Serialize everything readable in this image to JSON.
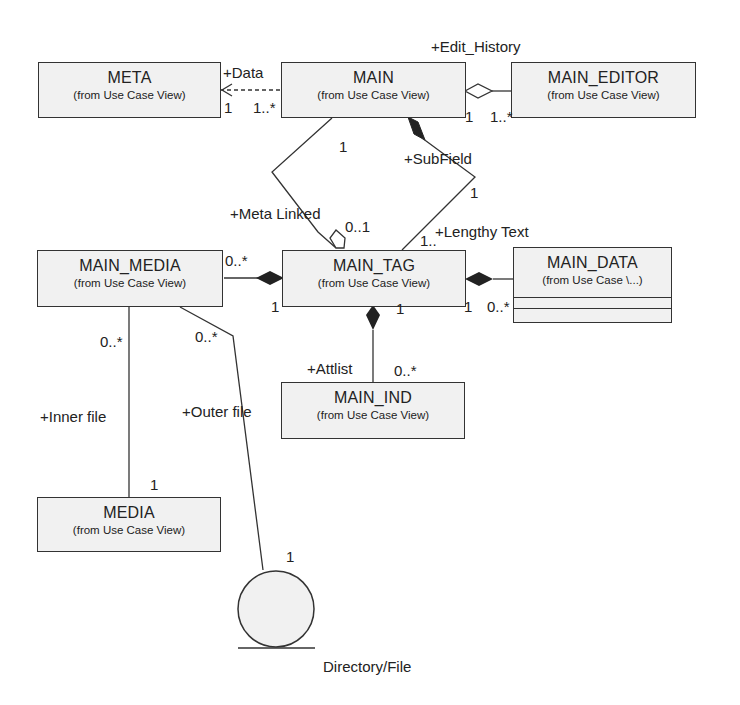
{
  "classes": {
    "meta": {
      "name": "META",
      "from": "(from Use Case View)"
    },
    "main": {
      "name": "MAIN",
      "from": "(from Use Case View)"
    },
    "main_editor": {
      "name": "MAIN_EDITOR",
      "from": "(from Use Case View)"
    },
    "main_media": {
      "name": "MAIN_MEDIA",
      "from": "(from Use Case View)"
    },
    "main_tag": {
      "name": "MAIN_TAG",
      "from": "(from Use Case View)"
    },
    "main_data": {
      "name": "MAIN_DATA",
      "from": "(from Use Case \\...)"
    },
    "main_ind": {
      "name": "MAIN_IND",
      "from": "(from Use Case View)"
    },
    "media": {
      "name": "MEDIA",
      "from": "(from Use Case View)"
    }
  },
  "actor": {
    "label": "Directory/File"
  },
  "associations": {
    "data": {
      "role": "+Data",
      "mult_meta": "1",
      "mult_main": "1..*"
    },
    "edit_history": {
      "role": "+Edit_History",
      "mult_main": "1",
      "mult_editor": "1..*"
    },
    "meta_linked": {
      "role": "+Meta Linked",
      "mult_main": "1",
      "mult_tag": "0..1"
    },
    "subfield": {
      "role": "+SubField",
      "mult_main": "1",
      "mult_tag": "1.."
    },
    "lengthy_text": {
      "role": "+Lengthy Text"
    },
    "media_tag": {
      "mult_media": "0..*",
      "mult_tag": "1"
    },
    "tag_data": {
      "mult_tag": "1",
      "mult_data": "0..*"
    },
    "attlist": {
      "role": "+Attlist",
      "mult_tag": "1",
      "mult_ind": "0..*"
    },
    "inner_file": {
      "role": "+Inner file",
      "mult_media_main": "0..*",
      "mult_media": "1"
    },
    "outer_file": {
      "role": "+Outer file",
      "mult_media_main": "0..*",
      "mult_actor": "1"
    }
  }
}
